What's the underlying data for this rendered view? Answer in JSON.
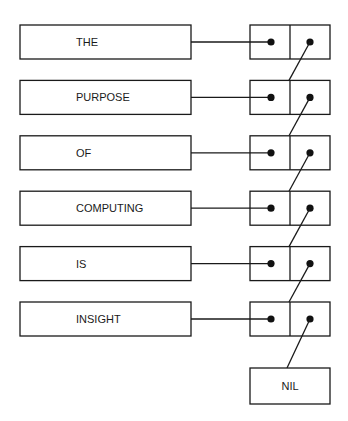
{
  "diagram": {
    "type": "linked-list",
    "nodes": [
      {
        "label": "THE"
      },
      {
        "label": "PURPOSE"
      },
      {
        "label": "OF"
      },
      {
        "label": "COMPUTING"
      },
      {
        "label": "IS"
      },
      {
        "label": "INSIGHT"
      }
    ],
    "terminator": {
      "label": "NIL"
    },
    "colors": {
      "ink": "#1a1a1a",
      "background": "#ffffff"
    }
  }
}
